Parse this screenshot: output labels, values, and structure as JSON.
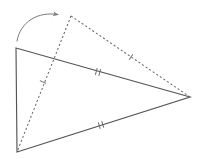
{
  "figure": {
    "background_color": "#ffffff",
    "stroke_color": "#4a4a4a",
    "solid_stroke_color": "#555555",
    "dashed_stroke_color": "#6b6b6b",
    "arrow_color": "#7a7a7a",
    "tick_color": "#666666",
    "width": 204,
    "height": 159
  },
  "solid_triangle": {
    "name": "original-triangle",
    "style": "solid",
    "vertices": [
      {
        "label": "A",
        "x": 16,
        "y": 48
      },
      {
        "label": "B",
        "x": 190,
        "y": 97
      },
      {
        "label": "C",
        "x": 17,
        "y": 152
      }
    ],
    "edges": [
      {
        "name": "edge-top",
        "from": "A",
        "to": "B",
        "ticks": 2
      },
      {
        "name": "edge-right",
        "from": "B",
        "to": "C",
        "ticks": 0
      },
      {
        "name": "edge-left",
        "from": "C",
        "to": "A",
        "ticks": 0
      }
    ]
  },
  "dashed_triangle": {
    "name": "rotated-triangle",
    "style": "dashed",
    "vertices": [
      {
        "label": "A'",
        "x": 71,
        "y": 16
      },
      {
        "label": "B'",
        "x": 190,
        "y": 97
      },
      {
        "label": "C'",
        "x": 17,
        "y": 152
      }
    ],
    "edges": [
      {
        "name": "edge-top-dashed",
        "from": "A'",
        "to": "B'",
        "ticks": 1
      },
      {
        "name": "edge-left-dashed",
        "from": "C'",
        "to": "A'",
        "ticks": 1
      }
    ]
  },
  "tick_marks": [
    {
      "name": "tick-solid-top",
      "count": 2,
      "x": 98,
      "y": 72,
      "angle": 16
    },
    {
      "name": "tick-solid-bottom",
      "count": 2,
      "x": 101,
      "y": 125,
      "angle": -17
    },
    {
      "name": "tick-dashed-upper",
      "count": 1,
      "x": 131,
      "y": 57,
      "angle": 34
    },
    {
      "name": "tick-dashed-lower",
      "count": 1,
      "x": 43,
      "y": 82,
      "angle": -65
    }
  ],
  "rotation_arrow": {
    "name": "rotation-arrow",
    "description": "curved arrow indicating rotation direction",
    "start": {
      "x": 17,
      "y": 41
    },
    "control": {
      "x": 28,
      "y": 12
    },
    "end": {
      "x": 61,
      "y": 15
    },
    "direction": "clockwise"
  }
}
